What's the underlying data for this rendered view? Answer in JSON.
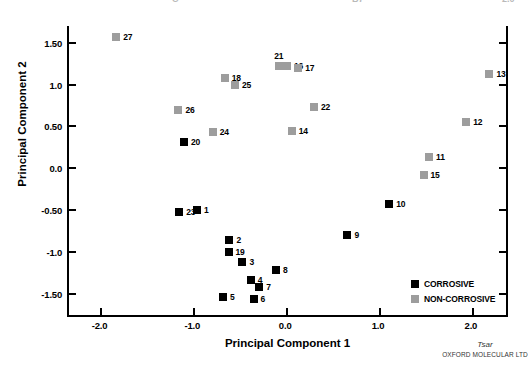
{
  "chart_data": {
    "type": "scatter",
    "title": "",
    "xlabel": "Principal Component 1",
    "ylabel": "Principal Component 2",
    "xlim": [
      -2.35,
      2.4
    ],
    "ylim": [
      -1.78,
      1.7
    ],
    "xticks": [
      "-2.0",
      "-1.0",
      "0.0",
      "1.0",
      "2.0"
    ],
    "xtick_values": [
      -2.0,
      -1.0,
      0.0,
      1.0,
      2.0
    ],
    "yticks": [
      "1.50",
      "1.0",
      "0.50",
      "0.0",
      "-0.50",
      "-1.0",
      "-1.50"
    ],
    "ytick_values": [
      1.5,
      1.0,
      0.5,
      0.0,
      -0.5,
      -1.0,
      -1.5
    ],
    "grid": false,
    "legend_position": "bottom-right",
    "series": [
      {
        "name": "CORROSIVE",
        "color": "#000000",
        "marker": "square",
        "points": [
          {
            "label": "23",
            "x": -1.14,
            "y": -0.53,
            "label_pos": "right"
          },
          {
            "label": "1",
            "x": -0.95,
            "y": -0.5,
            "label_pos": "right"
          },
          {
            "label": "20",
            "x": -1.09,
            "y": 0.31,
            "label_pos": "right"
          },
          {
            "label": "2",
            "x": -0.6,
            "y": -0.86,
            "label_pos": "right"
          },
          {
            "label": "19",
            "x": -0.61,
            "y": -1.0,
            "label_pos": "right"
          },
          {
            "label": "3",
            "x": -0.46,
            "y": -1.12,
            "label_pos": "right"
          },
          {
            "label": "4",
            "x": -0.37,
            "y": -1.34,
            "label_pos": "right"
          },
          {
            "label": "7",
            "x": -0.28,
            "y": -1.42,
            "label_pos": "right"
          },
          {
            "label": "8",
            "x": -0.1,
            "y": -1.22,
            "label_pos": "right"
          },
          {
            "label": "5",
            "x": -0.67,
            "y": -1.54,
            "label_pos": "right"
          },
          {
            "label": "6",
            "x": -0.34,
            "y": -1.57,
            "label_pos": "right"
          },
          {
            "label": "9",
            "x": 0.67,
            "y": -0.8,
            "label_pos": "right"
          },
          {
            "label": "10",
            "x": 1.12,
            "y": -0.43,
            "label_pos": "right"
          }
        ]
      },
      {
        "name": "NON-CORROSIVE",
        "color": "#9d9d9d",
        "marker": "square",
        "points": [
          {
            "label": "27",
            "x": -1.82,
            "y": 1.57,
            "label_pos": "right"
          },
          {
            "label": "26",
            "x": -1.15,
            "y": 0.7,
            "label_pos": "right"
          },
          {
            "label": "24",
            "x": -0.78,
            "y": 0.43,
            "label_pos": "right"
          },
          {
            "label": "18",
            "x": -0.65,
            "y": 1.08,
            "label_pos": "right"
          },
          {
            "label": "25",
            "x": -0.54,
            "y": 1.0,
            "label_pos": "right"
          },
          {
            "label": "21",
            "x": -0.07,
            "y": 1.22,
            "label_pos": "above"
          },
          {
            "label": "16",
            "x": 0.02,
            "y": 1.22,
            "label_pos": "right"
          },
          {
            "label": "17",
            "x": 0.14,
            "y": 1.2,
            "label_pos": "right"
          },
          {
            "label": "22",
            "x": 0.31,
            "y": 0.73,
            "label_pos": "right"
          },
          {
            "label": "14",
            "x": 0.07,
            "y": 0.45,
            "label_pos": "right"
          },
          {
            "label": "13",
            "x": 2.2,
            "y": 1.13,
            "label_pos": "right"
          },
          {
            "label": "12",
            "x": 1.95,
            "y": 0.55,
            "label_pos": "right"
          },
          {
            "label": "11",
            "x": 1.55,
            "y": 0.13,
            "label_pos": "right"
          },
          {
            "label": "15",
            "x": 1.49,
            "y": -0.08,
            "label_pos": "right"
          }
        ]
      }
    ]
  },
  "legend": {
    "items": [
      {
        "label": "CORROSIVE",
        "color": "#000000"
      },
      {
        "label": "NON-CORROSIVE",
        "color": "#9d9d9d"
      }
    ]
  },
  "watermark": {
    "brand": "Tsar",
    "company": "OXFORD MOLECULAR LTD"
  },
  "header_fragments": [
    {
      "text": "C",
      "x": 172
    },
    {
      "text": "B7",
      "x": 352
    },
    {
      "text": "2.0",
      "x": 502
    }
  ]
}
